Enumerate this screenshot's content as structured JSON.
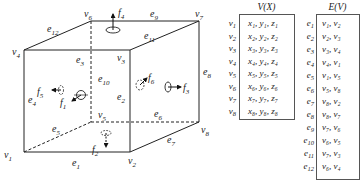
{
  "cube": {
    "vertices": [
      {
        "id": "v1",
        "label": "v",
        "sub": "1",
        "x": 24,
        "y": 152,
        "lx": 4,
        "ly": 158
      },
      {
        "id": "v2",
        "label": "v",
        "sub": "2",
        "x": 130,
        "y": 152,
        "lx": 128,
        "ly": 164
      },
      {
        "id": "v3",
        "label": "v",
        "sub": "3",
        "x": 130,
        "y": 50,
        "lx": 117,
        "ly": 61
      },
      {
        "id": "v4",
        "label": "v",
        "sub": "4",
        "x": 24,
        "y": 50,
        "lx": 12,
        "ly": 55
      },
      {
        "id": "v5",
        "label": "v",
        "sub": "5",
        "x": 91,
        "y": 122,
        "lx": 98,
        "ly": 118
      },
      {
        "id": "v6",
        "label": "v",
        "sub": "6",
        "x": 91,
        "y": 21,
        "lx": 84,
        "ly": 17
      },
      {
        "id": "v7",
        "label": "v",
        "sub": "7",
        "x": 199,
        "y": 21,
        "lx": 195,
        "ly": 17
      },
      {
        "id": "v8",
        "label": "v",
        "sub": "8",
        "x": 199,
        "y": 122,
        "lx": 201,
        "ly": 133
      }
    ],
    "edges": [
      {
        "id": "e1",
        "from": "v1",
        "to": "v2",
        "dashed": false,
        "lx": 72,
        "ly": 166
      },
      {
        "id": "e2",
        "from": "v2",
        "to": "v3",
        "dashed": false,
        "lx": 117,
        "ly": 100
      },
      {
        "id": "e3",
        "from": "v3",
        "to": "v4",
        "dashed": false,
        "lx": 76,
        "ly": 63
      },
      {
        "id": "e4",
        "from": "v4",
        "to": "v1",
        "dashed": false,
        "lx": 28,
        "ly": 103
      },
      {
        "id": "e5",
        "from": "v1",
        "to": "v5",
        "dashed": true,
        "lx": 52,
        "ly": 132
      },
      {
        "id": "e6",
        "from": "v5",
        "to": "v8",
        "dashed": true,
        "lx": 154,
        "ly": 117
      },
      {
        "id": "e7",
        "from": "v8",
        "to": "v2",
        "dashed": false,
        "lx": 167,
        "ly": 143
      },
      {
        "id": "e8",
        "from": "v8",
        "to": "v7",
        "dashed": false,
        "lx": 203,
        "ly": 75
      },
      {
        "id": "e9",
        "from": "v7",
        "to": "v6",
        "dashed": false,
        "lx": 150,
        "ly": 17
      },
      {
        "id": "e10",
        "from": "v6",
        "to": "v5",
        "dashed": true,
        "lx": 98,
        "ly": 82
      },
      {
        "id": "e11",
        "from": "v7",
        "to": "v3",
        "dashed": false,
        "lx": 144,
        "ly": 39
      },
      {
        "id": "e12",
        "from": "v6",
        "to": "v4",
        "dashed": false,
        "lx": 47,
        "ly": 32
      }
    ],
    "faces": [
      {
        "id": "f1",
        "label": "f",
        "sub": "1",
        "lx": 60,
        "ly": 106
      },
      {
        "id": "f2",
        "label": "f",
        "sub": "2",
        "lx": 92,
        "ly": 153
      },
      {
        "id": "f3",
        "label": "f",
        "sub": "3",
        "lx": 183,
        "ly": 91
      },
      {
        "id": "f4",
        "label": "f",
        "sub": "4",
        "lx": 118,
        "ly": 16
      },
      {
        "id": "f5",
        "label": "f",
        "sub": "5",
        "lx": 37,
        "ly": 95
      },
      {
        "id": "f6",
        "label": "f",
        "sub": "6",
        "lx": 148,
        "ly": 81
      }
    ]
  },
  "vertex_table": {
    "title": "V(X)",
    "rows": [
      {
        "key": "v",
        "key_sub": "1",
        "value": "x₁, y₁, z₁"
      },
      {
        "key": "v",
        "key_sub": "2",
        "value": "x₂, y₂, z₂"
      },
      {
        "key": "v",
        "key_sub": "3",
        "value": "x₃, y₃, z₃"
      },
      {
        "key": "v",
        "key_sub": "4",
        "value": "x₄, y₄, z₄"
      },
      {
        "key": "v",
        "key_sub": "5",
        "value": "x₅, y₅, z₅"
      },
      {
        "key": "v",
        "key_sub": "6",
        "value": "x₆, y₆, z₆"
      },
      {
        "key": "v",
        "key_sub": "7",
        "value": "x₇, y₇, z₇"
      },
      {
        "key": "v",
        "key_sub": "8",
        "value": "x₈, y₈, z₈"
      }
    ]
  },
  "edge_table": {
    "title": "E(V)",
    "rows": [
      {
        "key": "e",
        "key_sub": "1",
        "value": "v₁, v₂"
      },
      {
        "key": "e",
        "key_sub": "2",
        "value": "v₂, v₃"
      },
      {
        "key": "e",
        "key_sub": "3",
        "value": "v₃, v₄"
      },
      {
        "key": "e",
        "key_sub": "4",
        "value": "v₄, v₁"
      },
      {
        "key": "e",
        "key_sub": "5",
        "value": "v₁, v₅"
      },
      {
        "key": "e",
        "key_sub": "6",
        "value": "v₅, v₈"
      },
      {
        "key": "e",
        "key_sub": "7",
        "value": "v₈, v₂"
      },
      {
        "key": "e",
        "key_sub": "8",
        "value": "v₈, v₇"
      },
      {
        "key": "e",
        "key_sub": "9",
        "value": "v₇, v₆"
      },
      {
        "key": "e",
        "key_sub": "10",
        "value": "v₆, v₅"
      },
      {
        "key": "e",
        "key_sub": "11",
        "value": "v₇, v₃"
      },
      {
        "key": "e",
        "key_sub": "12",
        "value": "v₆, v₄"
      }
    ]
  }
}
